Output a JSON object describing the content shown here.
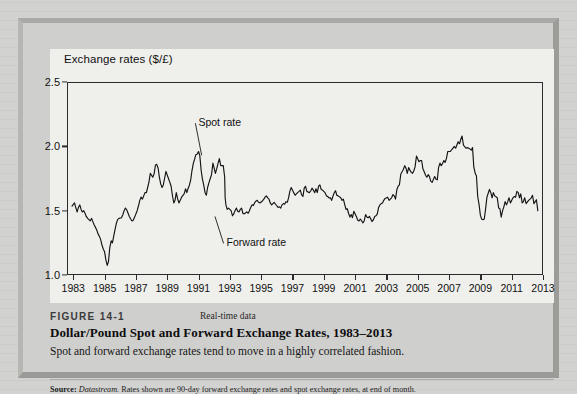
{
  "figure": {
    "number_label": "FIGURE 14-1",
    "realtime_label": "Real-time data",
    "title": "Dollar/Pound Spot and Forward Exchange Rates, 1983–2013",
    "subtitle": "Spot and forward exchange rates tend to move in a highly correlated fashion.",
    "source_prefix": "Source:",
    "source_italic": "Datastream.",
    "source_rest": " Rates shown are 90-day forward exchange rates and spot exchange rates, at end of month."
  },
  "colors": {
    "page_background": "#d2d2d0",
    "figure_background": "#cfcfcd",
    "plot_background": "#efefec",
    "line": "#141414",
    "axis": "#2c2c2c",
    "text": "#111111"
  },
  "chart_data": {
    "type": "line",
    "title": "Exchange rates ($/£)",
    "xlabel": "",
    "ylabel": "Exchange rates ($/£)",
    "xlim": [
      1982.6,
      2013.0
    ],
    "ylim": [
      1.0,
      2.5
    ],
    "yticks": [
      1.0,
      1.5,
      2.0,
      2.5
    ],
    "ytick_labels": [
      "1.0",
      "1.5",
      "2.0",
      "2.5"
    ],
    "xticks": [
      1983,
      1985,
      1987,
      1989,
      1991,
      1993,
      1995,
      1997,
      1999,
      2001,
      2003,
      2005,
      2007,
      2009,
      2011,
      2013
    ],
    "xtick_labels": [
      "1983",
      "1985",
      "1987",
      "1989",
      "1991",
      "1993",
      "1995",
      "1997",
      "1999",
      "2001",
      "2003",
      "2005",
      "2007",
      "2009",
      "2011",
      "2013"
    ],
    "grid": false,
    "legend": "none",
    "annotations": [
      {
        "text": "Spot rate",
        "label_x": 1990.8,
        "label_y": 2.18,
        "point_x": 1991.2,
        "point_y": 1.93
      },
      {
        "text": "Forward rate",
        "label_x": 1992.6,
        "label_y": 1.245,
        "point_x": 1992.05,
        "point_y": 1.455
      }
    ],
    "series": [
      {
        "name": "Spot rate",
        "note": "Spot and forward series overlap nearly exactly at this scale and are drawn as one visual trace.",
        "x": [
          1982.92,
          1983.08,
          1983.17,
          1983.25,
          1983.33,
          1983.42,
          1983.5,
          1983.58,
          1983.67,
          1983.75,
          1983.83,
          1983.92,
          1984.08,
          1984.17,
          1984.25,
          1984.33,
          1984.42,
          1984.5,
          1984.58,
          1984.67,
          1984.75,
          1984.83,
          1984.92,
          1985.0,
          1985.08,
          1985.17,
          1985.25,
          1985.33,
          1985.42,
          1985.5,
          1985.58,
          1985.67,
          1985.75,
          1985.83,
          1985.92,
          1986.08,
          1986.17,
          1986.25,
          1986.33,
          1986.42,
          1986.5,
          1986.58,
          1986.67,
          1986.75,
          1986.83,
          1986.92,
          1987.08,
          1987.17,
          1987.25,
          1987.33,
          1987.42,
          1987.5,
          1987.58,
          1987.67,
          1987.75,
          1987.83,
          1987.92,
          1988.08,
          1988.17,
          1988.25,
          1988.33,
          1988.42,
          1988.5,
          1988.58,
          1988.67,
          1988.75,
          1988.83,
          1988.92,
          1989.08,
          1989.17,
          1989.25,
          1989.33,
          1989.42,
          1989.5,
          1989.58,
          1989.67,
          1989.75,
          1989.83,
          1989.92,
          1990.08,
          1990.17,
          1990.25,
          1990.33,
          1990.42,
          1990.5,
          1990.58,
          1990.67,
          1990.75,
          1990.83,
          1990.92,
          1991.0,
          1991.08,
          1991.17,
          1991.25,
          1991.33,
          1991.42,
          1991.5,
          1991.58,
          1991.67,
          1991.75,
          1991.83,
          1991.92,
          1992.08,
          1992.17,
          1992.25,
          1992.33,
          1992.42,
          1992.58,
          1992.67,
          1992.7,
          1992.75,
          1992.83,
          1992.92,
          1993.08,
          1993.17,
          1993.25,
          1993.33,
          1993.42,
          1993.5,
          1993.58,
          1993.67,
          1993.75,
          1993.83,
          1993.92,
          1994.08,
          1994.17,
          1994.25,
          1994.33,
          1994.42,
          1994.5,
          1994.58,
          1994.67,
          1994.75,
          1994.83,
          1994.92,
          1995.08,
          1995.17,
          1995.25,
          1995.33,
          1995.42,
          1995.5,
          1995.58,
          1995.67,
          1995.75,
          1995.83,
          1995.92,
          1996.08,
          1996.17,
          1996.25,
          1996.33,
          1996.42,
          1996.5,
          1996.58,
          1996.67,
          1996.75,
          1996.83,
          1996.92,
          1997.08,
          1997.17,
          1997.25,
          1997.33,
          1997.42,
          1997.5,
          1997.58,
          1997.67,
          1997.75,
          1997.83,
          1997.92,
          1998.08,
          1998.17,
          1998.25,
          1998.33,
          1998.42,
          1998.5,
          1998.58,
          1998.67,
          1998.75,
          1998.83,
          1998.92,
          1999.08,
          1999.17,
          1999.25,
          1999.33,
          1999.42,
          1999.5,
          1999.58,
          1999.67,
          1999.75,
          1999.83,
          1999.92,
          2000.08,
          2000.17,
          2000.25,
          2000.33,
          2000.42,
          2000.5,
          2000.58,
          2000.67,
          2000.75,
          2000.83,
          2000.92,
          2001.08,
          2001.17,
          2001.25,
          2001.33,
          2001.42,
          2001.5,
          2001.58,
          2001.67,
          2001.75,
          2001.83,
          2001.92,
          2002.08,
          2002.17,
          2002.25,
          2002.33,
          2002.42,
          2002.5,
          2002.58,
          2002.67,
          2002.75,
          2002.83,
          2002.92,
          2003.08,
          2003.17,
          2003.25,
          2003.33,
          2003.42,
          2003.5,
          2003.58,
          2003.67,
          2003.75,
          2003.83,
          2003.92,
          2004.08,
          2004.17,
          2004.25,
          2004.33,
          2004.42,
          2004.5,
          2004.58,
          2004.67,
          2004.75,
          2004.83,
          2004.92,
          2005.08,
          2005.17,
          2005.25,
          2005.33,
          2005.42,
          2005.5,
          2005.58,
          2005.67,
          2005.75,
          2005.83,
          2005.92,
          2006.08,
          2006.17,
          2006.25,
          2006.33,
          2006.42,
          2006.5,
          2006.58,
          2006.67,
          2006.75,
          2006.83,
          2006.92,
          2007.08,
          2007.17,
          2007.25,
          2007.33,
          2007.42,
          2007.5,
          2007.58,
          2007.67,
          2007.75,
          2007.83,
          2007.92,
          2008.08,
          2008.17,
          2008.25,
          2008.33,
          2008.42,
          2008.5,
          2008.58,
          2008.67,
          2008.75,
          2008.83,
          2008.92,
          2009.0,
          2009.08,
          2009.17,
          2009.25,
          2009.33,
          2009.42,
          2009.5,
          2009.58,
          2009.67,
          2009.75,
          2009.83,
          2009.92,
          2010.08,
          2010.17,
          2010.25,
          2010.33,
          2010.42,
          2010.5,
          2010.58,
          2010.67,
          2010.75,
          2010.83,
          2010.92,
          2011.08,
          2011.17,
          2011.25,
          2011.33,
          2011.42,
          2011.5,
          2011.58,
          2011.67,
          2011.75,
          2011.83,
          2011.92,
          2012.08,
          2012.17,
          2012.25,
          2012.33,
          2012.42,
          2012.5,
          2012.58,
          2012.67
        ],
        "y": [
          1.535,
          1.56,
          1.52,
          1.49,
          1.525,
          1.545,
          1.51,
          1.49,
          1.5,
          1.48,
          1.455,
          1.44,
          1.42,
          1.44,
          1.415,
          1.39,
          1.37,
          1.35,
          1.32,
          1.3,
          1.275,
          1.235,
          1.2,
          1.18,
          1.12,
          1.075,
          1.105,
          1.21,
          1.265,
          1.25,
          1.3,
          1.355,
          1.4,
          1.43,
          1.44,
          1.445,
          1.47,
          1.5,
          1.52,
          1.505,
          1.48,
          1.455,
          1.435,
          1.42,
          1.425,
          1.45,
          1.5,
          1.54,
          1.58,
          1.605,
          1.59,
          1.615,
          1.64,
          1.64,
          1.68,
          1.72,
          1.79,
          1.76,
          1.79,
          1.855,
          1.86,
          1.83,
          1.76,
          1.71,
          1.68,
          1.7,
          1.75,
          1.805,
          1.75,
          1.72,
          1.69,
          1.62,
          1.56,
          1.58,
          1.64,
          1.59,
          1.56,
          1.58,
          1.605,
          1.63,
          1.67,
          1.64,
          1.67,
          1.7,
          1.74,
          1.81,
          1.87,
          1.9,
          1.935,
          1.94,
          1.96,
          1.93,
          1.81,
          1.745,
          1.7,
          1.64,
          1.62,
          1.68,
          1.72,
          1.75,
          1.78,
          1.87,
          1.79,
          1.83,
          1.87,
          1.905,
          1.85,
          1.85,
          1.76,
          1.6,
          1.545,
          1.51,
          1.52,
          1.5,
          1.46,
          1.475,
          1.5,
          1.52,
          1.495,
          1.49,
          1.51,
          1.52,
          1.48,
          1.475,
          1.49,
          1.48,
          1.5,
          1.525,
          1.545,
          1.54,
          1.56,
          1.575,
          1.58,
          1.565,
          1.56,
          1.575,
          1.59,
          1.605,
          1.615,
          1.6,
          1.59,
          1.56,
          1.545,
          1.555,
          1.565,
          1.55,
          1.525,
          1.53,
          1.52,
          1.545,
          1.555,
          1.55,
          1.57,
          1.565,
          1.6,
          1.65,
          1.68,
          1.64,
          1.62,
          1.63,
          1.64,
          1.65,
          1.66,
          1.625,
          1.61,
          1.675,
          1.69,
          1.65,
          1.64,
          1.655,
          1.675,
          1.66,
          1.64,
          1.67,
          1.64,
          1.69,
          1.7,
          1.665,
          1.66,
          1.64,
          1.615,
          1.61,
          1.6,
          1.6,
          1.58,
          1.61,
          1.64,
          1.655,
          1.62,
          1.615,
          1.6,
          1.58,
          1.59,
          1.55,
          1.51,
          1.515,
          1.48,
          1.45,
          1.47,
          1.445,
          1.495,
          1.455,
          1.425,
          1.42,
          1.435,
          1.42,
          1.405,
          1.42,
          1.47,
          1.45,
          1.445,
          1.455,
          1.415,
          1.43,
          1.455,
          1.46,
          1.475,
          1.525,
          1.545,
          1.555,
          1.56,
          1.58,
          1.595,
          1.605,
          1.58,
          1.59,
          1.6,
          1.625,
          1.615,
          1.59,
          1.665,
          1.69,
          1.7,
          1.785,
          1.82,
          1.85,
          1.83,
          1.79,
          1.835,
          1.815,
          1.8,
          1.79,
          1.81,
          1.84,
          1.925,
          1.88,
          1.89,
          1.89,
          1.825,
          1.8,
          1.775,
          1.76,
          1.78,
          1.765,
          1.73,
          1.72,
          1.765,
          1.745,
          1.74,
          1.835,
          1.87,
          1.85,
          1.865,
          1.89,
          1.875,
          1.905,
          1.96,
          1.96,
          1.975,
          1.985,
          2.0,
          1.985,
          2.01,
          2.035,
          2.02,
          2.055,
          2.08,
          2.01,
          1.985,
          1.99,
          1.985,
          1.98,
          1.97,
          1.99,
          1.84,
          1.79,
          1.77,
          1.61,
          1.545,
          1.465,
          1.435,
          1.43,
          1.435,
          1.51,
          1.605,
          1.635,
          1.665,
          1.64,
          1.6,
          1.64,
          1.615,
          1.6,
          1.52,
          1.515,
          1.45,
          1.5,
          1.53,
          1.57,
          1.545,
          1.57,
          1.6,
          1.56,
          1.6,
          1.61,
          1.605,
          1.65,
          1.64,
          1.6,
          1.63,
          1.56,
          1.57,
          1.6,
          1.555,
          1.58,
          1.59,
          1.6,
          1.62,
          1.555,
          1.57,
          1.585,
          1.5
        ]
      }
    ]
  }
}
